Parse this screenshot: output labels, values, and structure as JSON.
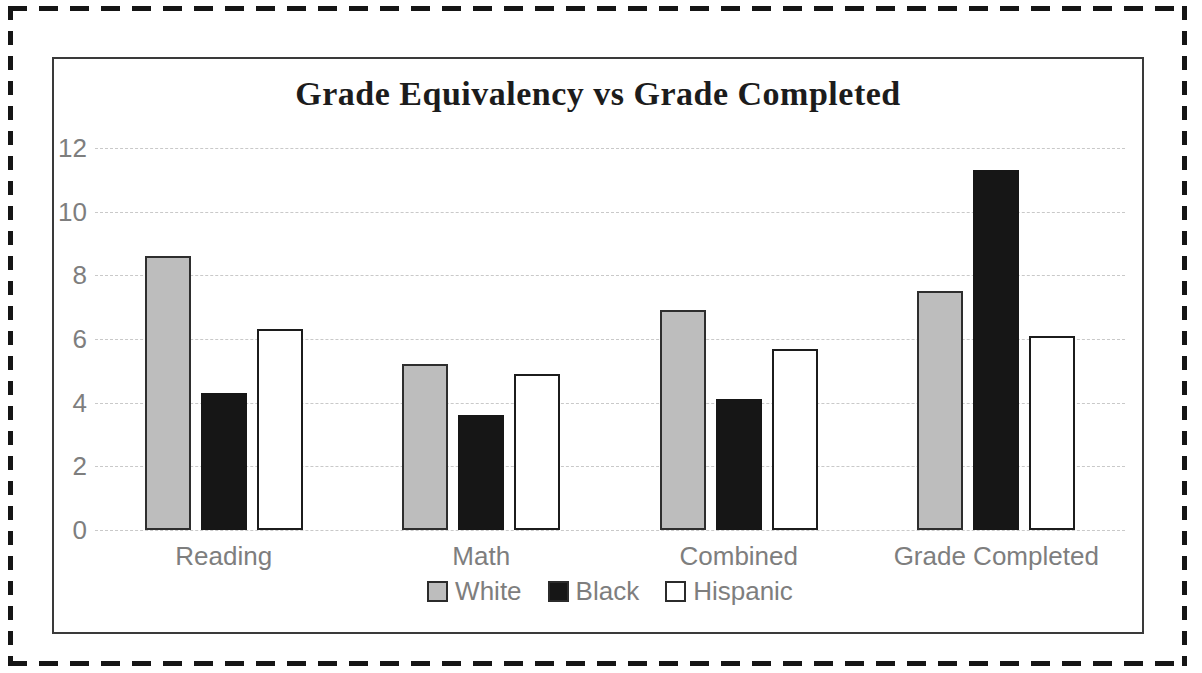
{
  "chart_data": {
    "type": "bar",
    "title": "Grade Equivalency vs Grade Completed",
    "categories": [
      "Reading",
      "Math",
      "Combined",
      "Grade Completed"
    ],
    "series": [
      {
        "name": "White",
        "values": [
          8.6,
          5.2,
          6.9,
          7.5
        ],
        "fill": "#bdbdbd",
        "border": "#2e2e2e"
      },
      {
        "name": "Black",
        "values": [
          4.3,
          3.6,
          4.1,
          11.3
        ],
        "fill": "#161616",
        "border": "#161616"
      },
      {
        "name": "Hispanic",
        "values": [
          6.3,
          4.9,
          5.7,
          6.1
        ],
        "fill": "#ffffff",
        "border": "#1c1c1c"
      }
    ],
    "xlabel": "",
    "ylabel": "",
    "ylim": [
      0,
      12
    ],
    "yticks": [
      0,
      2,
      4,
      6,
      8,
      10,
      12
    ],
    "grid": true,
    "legend_position": "bottom"
  },
  "colors": {
    "axis_text": "#7e7e7e",
    "gridline": "#c9c9c9",
    "title_text": "#1c1c1c",
    "chart_border": "#3a3a3a",
    "frame_dash": "#151515"
  }
}
